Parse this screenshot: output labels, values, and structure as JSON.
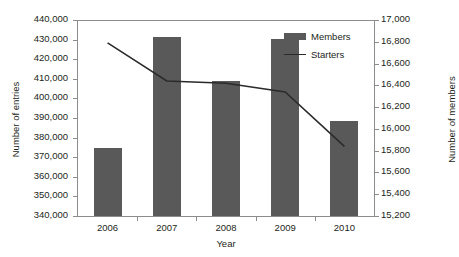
{
  "chart_data": {
    "type": "bar",
    "title": "",
    "xlabel": "Year",
    "categories": [
      "2006",
      "2007",
      "2008",
      "2009",
      "2010"
    ],
    "grid": false,
    "legend_position": "inside-top-right",
    "axes": {
      "left": {
        "label": "Number of entries",
        "min": 340000,
        "max": 440000,
        "step": 10000,
        "ticks": [
          "340,000",
          "350,000",
          "360,000",
          "370,000",
          "380,000",
          "390,000",
          "400,000",
          "410,000",
          "420,000",
          "430,000",
          "440,000"
        ],
        "tick_values": [
          340000,
          350000,
          360000,
          370000,
          380000,
          390000,
          400000,
          410000,
          420000,
          430000,
          440000
        ]
      },
      "right": {
        "label": "Number of members",
        "min": 15200,
        "max": 17000,
        "step": 200,
        "ticks": [
          "15,200",
          "15,400",
          "15,600",
          "15,800",
          "16,000",
          "16,200",
          "16,400",
          "16,600",
          "16,800",
          "17,000"
        ],
        "tick_values": [
          15200,
          15400,
          15600,
          15800,
          16000,
          16200,
          16400,
          16600,
          16800,
          17000
        ]
      }
    },
    "series": [
      {
        "name": "Members",
        "type": "bar",
        "axis": "left",
        "color": "#595959",
        "values": [
          374500,
          431500,
          409000,
          430500,
          388500
        ]
      },
      {
        "name": "Starters",
        "type": "line",
        "axis": "right",
        "color": "#2b2b2b",
        "values": [
          16790,
          16440,
          16420,
          16340,
          15840
        ]
      }
    ]
  },
  "legend": {
    "items": [
      {
        "label": "Members",
        "marker": "bar-swatch",
        "color": "#595959"
      },
      {
        "label": "Starters",
        "marker": "line-swatch",
        "color": "#2b2b2b"
      }
    ]
  }
}
